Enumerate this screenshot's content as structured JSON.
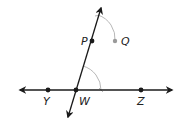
{
  "diagram": {
    "colors": {
      "line": "#1a1a1a",
      "arc": "#b8b8b8",
      "point_q": "#9a9a9a",
      "text": "#222222"
    },
    "points": {
      "Y": {
        "label": "Y",
        "x": 48,
        "y": 90
      },
      "W": {
        "label": "W",
        "x": 76,
        "y": 90
      },
      "Z": {
        "label": "Z",
        "x": 141,
        "y": 90
      },
      "P": {
        "label": "P",
        "x": 92,
        "y": 41
      },
      "Q": {
        "label": "Q",
        "x": 115,
        "y": 41
      }
    },
    "lines": [
      {
        "name": "line-YZ",
        "type": "line",
        "through": [
          "Y",
          "W",
          "Z"
        ]
      },
      {
        "name": "line-WP",
        "type": "line",
        "through": [
          "W",
          "P"
        ]
      }
    ],
    "arcs": [
      {
        "name": "arc-at-W",
        "center": "W"
      },
      {
        "name": "arc-at-P",
        "center": "P"
      }
    ]
  }
}
